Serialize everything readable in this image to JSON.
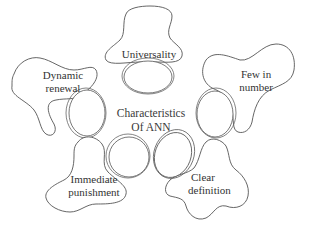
{
  "diagram": {
    "title": "Characteristics Of ANN",
    "center": {
      "line1": "Characteristics",
      "line2": "Of ANN"
    },
    "nodes": [
      {
        "id": "universality",
        "line1": "Universality",
        "line2": ""
      },
      {
        "id": "few-in-number",
        "line1": "Few in",
        "line2": "number"
      },
      {
        "id": "clear-definition",
        "line1": "Clear",
        "line2": "definition"
      },
      {
        "id": "immediate-punishment",
        "line1": "Immediate",
        "line2": "punishment"
      },
      {
        "id": "dynamic-renewal",
        "line1": "Dynamic",
        "line2": "renewal"
      }
    ],
    "colors": {
      "stroke": "#555555",
      "text": "#333333",
      "background": "#ffffff"
    }
  }
}
